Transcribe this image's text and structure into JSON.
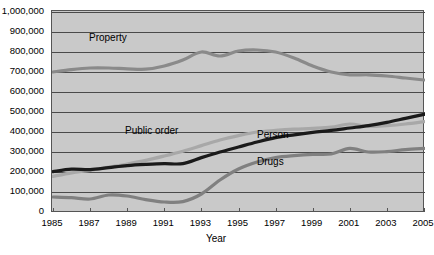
{
  "chart_data": {
    "type": "line",
    "title": "",
    "xlabel": "Year",
    "ylabel": "",
    "x": [
      1985,
      1986,
      1987,
      1988,
      1989,
      1990,
      1991,
      1992,
      1993,
      1994,
      1995,
      1996,
      1997,
      1998,
      1999,
      2000,
      2001,
      2002,
      2003,
      2004,
      2005
    ],
    "xlim": [
      1985,
      2005
    ],
    "ylim": [
      0,
      1000000
    ],
    "grid": true,
    "legend_position": "inline-labels",
    "xticks": [
      "1985",
      "1987",
      "1989",
      "1991",
      "1993",
      "1995",
      "1997",
      "1999",
      "2001",
      "2003",
      "2005"
    ],
    "yticks": [
      "0",
      "100,000",
      "200,000",
      "300,000",
      "400,000",
      "500,000",
      "600,000",
      "700,000",
      "800,000",
      "900,000",
      "1,000,000"
    ],
    "series": [
      {
        "name": "Property",
        "color": "#8a8a8a",
        "width": 3.2,
        "values": [
          700000,
          712000,
          720000,
          720000,
          716000,
          714000,
          730000,
          760000,
          800000,
          780000,
          805000,
          810000,
          800000,
          770000,
          730000,
          700000,
          686000,
          686000,
          680000,
          670000,
          660000
        ]
      },
      {
        "name": "Public order",
        "color": "#a8a8a8",
        "width": 3.2,
        "values": [
          178000,
          196000,
          208000,
          224000,
          240000,
          258000,
          280000,
          304000,
          332000,
          360000,
          382000,
          400000,
          408000,
          414000,
          418000,
          424000,
          440000,
          428000,
          432000,
          440000,
          452000
        ]
      },
      {
        "name": "Person",
        "color": "#1a1a1a",
        "width": 3.2,
        "values": [
          202000,
          214000,
          212000,
          222000,
          232000,
          238000,
          242000,
          242000,
          272000,
          300000,
          325000,
          350000,
          372000,
          386000,
          398000,
          408000,
          420000,
          432000,
          448000,
          468000,
          488000
        ]
      },
      {
        "name": "Drugs",
        "color": "#808080",
        "width": 3.2,
        "values": [
          75000,
          72000,
          65000,
          85000,
          80000,
          62000,
          50000,
          52000,
          90000,
          160000,
          215000,
          250000,
          272000,
          282000,
          288000,
          290000,
          318000,
          300000,
          302000,
          312000,
          318000
        ]
      }
    ],
    "series_labels": [
      {
        "name": "Property",
        "text": "Property",
        "x": 89,
        "y": 33
      },
      {
        "name": "Public order",
        "text": "Public order",
        "x": 125,
        "y": 126
      },
      {
        "name": "Person",
        "text": "Person",
        "x": 257,
        "y": 130
      },
      {
        "name": "Drugs",
        "text": "Drugs",
        "x": 257,
        "y": 157
      }
    ],
    "axis": {
      "x_title": "Year"
    },
    "caption": ""
  },
  "axis": {
    "x_title": "Year",
    "y_ticks": [
      {
        "label": "1,000,000",
        "value": 1000000
      },
      {
        "label": "900,000",
        "value": 900000
      },
      {
        "label": "800,000",
        "value": 800000
      },
      {
        "label": "700,000",
        "value": 700000
      },
      {
        "label": "600,000",
        "value": 600000
      },
      {
        "label": "500,000",
        "value": 500000
      },
      {
        "label": "400,000",
        "value": 400000
      },
      {
        "label": "300,000",
        "value": 300000
      },
      {
        "label": "200,000",
        "value": 200000
      },
      {
        "label": "100,000",
        "value": 100000
      },
      {
        "label": "0",
        "value": 0
      }
    ],
    "x_ticks": [
      {
        "label": "1985",
        "value": 1985
      },
      {
        "label": "1987",
        "value": 1987
      },
      {
        "label": "1989",
        "value": 1989
      },
      {
        "label": "1991",
        "value": 1991
      },
      {
        "label": "1993",
        "value": 1993
      },
      {
        "label": "1995",
        "value": 1995
      },
      {
        "label": "1997",
        "value": 1997
      },
      {
        "label": "1999",
        "value": 1999
      },
      {
        "label": "2001",
        "value": 2001
      },
      {
        "label": "2003",
        "value": 2003
      },
      {
        "label": "2005",
        "value": 2005
      }
    ]
  },
  "style": {
    "plot_background": "#c9c9c9",
    "page_background": "#ffffff",
    "gridline_color": "#4a4a4a",
    "axis_color": "#555555"
  }
}
